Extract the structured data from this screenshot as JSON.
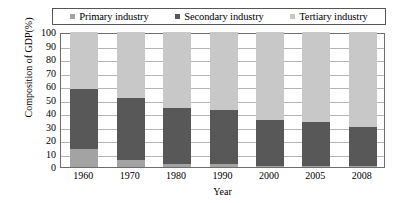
{
  "legend": {
    "position": "top",
    "entries": [
      {
        "label": "Primary industry",
        "color": "#a3a3a3",
        "icon": "square-swatch-icon"
      },
      {
        "label": "Secondary industry",
        "color": "#585858",
        "icon": "square-swatch-icon"
      },
      {
        "label": "Tertiary industry",
        "color": "#c8c8c8",
        "icon": "square-swatch-icon"
      }
    ]
  },
  "axes": {
    "y_title": "Composition of GDP(%)",
    "x_title": "Year",
    "y_ticks": [
      "0",
      "10",
      "20",
      "30",
      "40",
      "50",
      "60",
      "70",
      "80",
      "90",
      "100"
    ]
  },
  "chart_data": {
    "type": "bar",
    "title": "",
    "subtitle": "",
    "stacked": true,
    "stack_mode": "percent",
    "orientation": "vertical",
    "xlabel": "Year",
    "ylabel": "Composition of GDP(%)",
    "ylim": [
      0,
      100
    ],
    "ytick_step": 10,
    "grid": true,
    "legend_position": "top",
    "categories": [
      "1960",
      "1970",
      "1980",
      "1990",
      "2000",
      "2005",
      "2008"
    ],
    "series": [
      {
        "name": "Primary industry",
        "color": "#a3a3a3",
        "values": [
          13,
          5,
          2,
          2,
          1,
          1,
          1
        ]
      },
      {
        "name": "Secondary industry",
        "color": "#585858",
        "values": [
          45,
          46,
          42,
          40,
          34,
          32,
          29
        ]
      },
      {
        "name": "Tertiary industry",
        "color": "#c8c8c8",
        "values": [
          42,
          49,
          56,
          58,
          65,
          67,
          70
        ]
      }
    ],
    "cumulative_tops": {
      "Primary industry": [
        13,
        5,
        2,
        2,
        1,
        1,
        1
      ],
      "Secondary industry": [
        58,
        51,
        44,
        42,
        35,
        33,
        30
      ],
      "Tertiary industry": [
        100,
        100,
        100,
        100,
        100,
        100,
        100
      ]
    }
  }
}
